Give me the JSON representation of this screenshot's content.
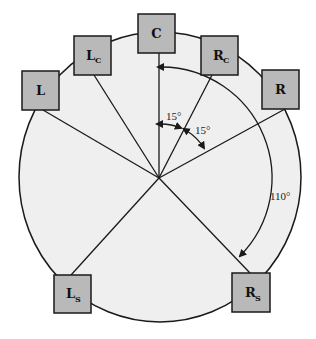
{
  "diagram": {
    "title": "",
    "colors": {
      "circle_fill": "#efefef",
      "box_fill": "#b9b9b9",
      "stroke": "#1a1a1a"
    },
    "speakers": [
      {
        "id": "L",
        "label": "L",
        "sub": ""
      },
      {
        "id": "Lc",
        "label": "L",
        "sub": "C"
      },
      {
        "id": "C",
        "label": "C",
        "sub": ""
      },
      {
        "id": "Rc",
        "label": "R",
        "sub": "C"
      },
      {
        "id": "R",
        "label": "R",
        "sub": ""
      },
      {
        "id": "Ls",
        "label": "L",
        "sub": "S"
      },
      {
        "id": "Rs",
        "label": "R",
        "sub": "S"
      }
    ],
    "angles": {
      "c_to_rc": "15°",
      "rc_to_r": "15°",
      "c_to_rs": "110°"
    }
  }
}
